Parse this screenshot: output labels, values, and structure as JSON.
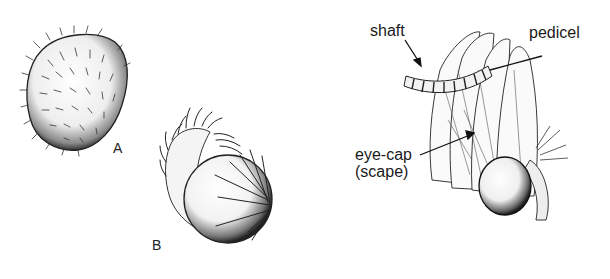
{
  "figure": {
    "panels": [
      {
        "id": "A",
        "letter": "A",
        "description": "hairy ovoid eye (uncovered)"
      },
      {
        "id": "B",
        "letter": "B",
        "description": "eye partly covered by scale-bearing eye-cap"
      },
      {
        "id": "C",
        "description": "antenna base with eye-cap covering eye"
      }
    ],
    "labels": {
      "shaft": "shaft",
      "pedicel": "pedicel",
      "eyecap_line1": "eye-cap",
      "eyecap_line2": "(scape)"
    },
    "colors": {
      "ink": "#1a1a1a",
      "background": "#ffffff"
    }
  }
}
